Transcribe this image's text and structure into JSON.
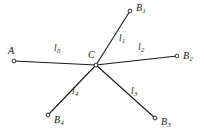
{
  "figure": {
    "type": "star-graph-diagram",
    "background_color": "#ffffff",
    "stroke_color": "#1a1a1a",
    "width": 204,
    "height": 137,
    "center": {
      "id": "C",
      "label": "C",
      "label_sub": "",
      "x": 96,
      "y": 65,
      "label_x": 88,
      "label_y": 50
    },
    "nodes": [
      {
        "id": "A",
        "label": "A",
        "label_sub": "",
        "x": 14,
        "y": 61,
        "label_x": 8,
        "label_y": 46
      },
      {
        "id": "B1",
        "label": "B",
        "label_sub": "1",
        "x": 130,
        "y": 11,
        "label_x": 136,
        "label_y": 3
      },
      {
        "id": "B2",
        "label": "B",
        "label_sub": "2",
        "x": 177,
        "y": 56,
        "label_x": 183,
        "label_y": 51
      },
      {
        "id": "B3",
        "label": "B",
        "label_sub": "3",
        "x": 155,
        "y": 118,
        "label_x": 161,
        "label_y": 117
      },
      {
        "id": "B4",
        "label": "B",
        "label_sub": "4",
        "x": 48,
        "y": 115,
        "label_x": 54,
        "label_y": 115
      }
    ],
    "edges": [
      {
        "id": "l0",
        "from": "A",
        "to": "C",
        "label": "l",
        "label_sub": "0",
        "label_x": 54,
        "label_y": 44
      },
      {
        "id": "l1",
        "from": "C",
        "to": "B1",
        "label": "l",
        "label_sub": "1",
        "label_x": 119,
        "label_y": 34
      },
      {
        "id": "l2",
        "from": "C",
        "to": "B2",
        "label": "l",
        "label_sub": "2",
        "label_x": 138,
        "label_y": 43
      },
      {
        "id": "l3",
        "from": "C",
        "to": "B3",
        "label": "l",
        "label_sub": "3",
        "label_x": 131,
        "label_y": 87
      },
      {
        "id": "l4",
        "from": "C",
        "to": "B4",
        "label": "l",
        "label_sub": "4",
        "label_x": 72,
        "label_y": 87
      }
    ]
  }
}
